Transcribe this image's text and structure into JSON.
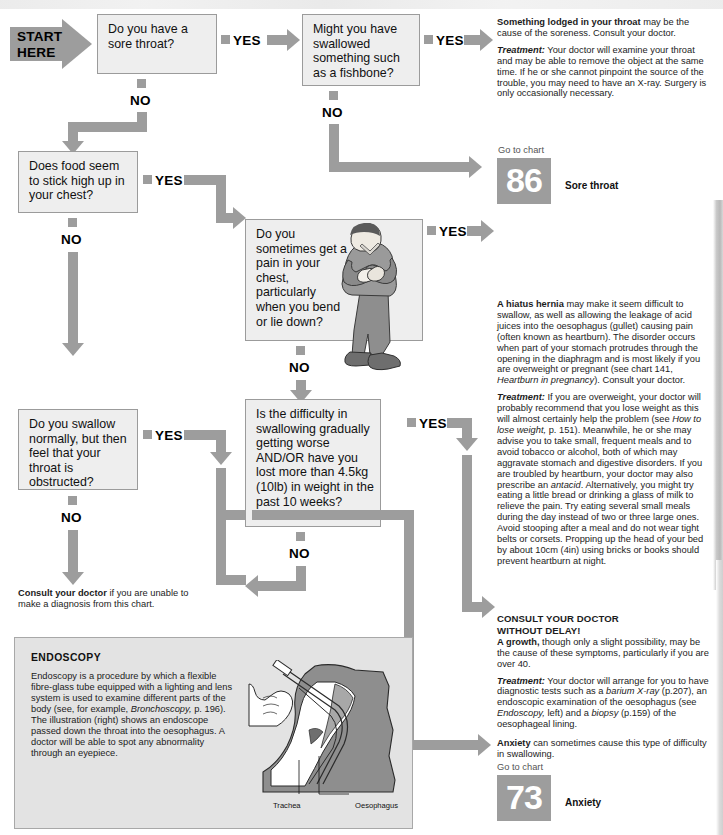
{
  "chart": {
    "start_line1": "START",
    "start_line2": "HERE"
  },
  "questions": [
    {
      "id": "q1",
      "text": "Do you have a sore throat?"
    },
    {
      "id": "q2",
      "text": "Might you have swallowed something such as a fishbone?"
    },
    {
      "id": "q3",
      "text": "Does food seem to stick high up in your chest?"
    },
    {
      "id": "q4",
      "text": "Do you sometimes get a pain in your chest, particularly when you bend or lie down?"
    },
    {
      "id": "q5",
      "text": "Do you swallow normally, but then feel that your throat is obstructed?"
    },
    {
      "id": "q6",
      "text": "Is the difficulty in swallowing gradually getting worse AND/OR have you lost more than 4.5kg (10lb) in weight in the past 10 weeks?"
    }
  ],
  "branch_labels": {
    "yes": "YES",
    "no": "NO"
  },
  "advice": {
    "lodged": {
      "lead": "Something lodged in your throat",
      "lead_rest": " may be the cause of the soreness. Consult your doctor.",
      "treatment_label": "Treatment:",
      "treatment_text": " Your doctor will examine your throat and may be able to remove the object at the same time. If he or she cannot pinpoint the source of the trouble, you may need to have an X-ray. Surgery is only occasionally necessary."
    },
    "sore_throat_goto": {
      "goto": "Go to chart",
      "number": "86",
      "name": "Sore throat"
    },
    "hernia": {
      "lead": "A hiatus hernia",
      "lead_rest": " may make it seem difficult to swallow, as well as allowing the leakage of acid juices into the oesophagus (gullet) causing pain (often known as heartburn). The disorder occurs when part of your stomach protrudes through the opening in the diaphragm and is most likely if you are overweight or pregnant (see chart 141, ",
      "lead_italic": "Heartburn in pregnancy",
      "lead_tail": "). Consult your doctor.",
      "treatment_label": "Treatment:",
      "treatment_t1": " If you are overweight, your doctor will probably recommend that you lose weight as this will almost certainly help the problem (see ",
      "treatment_i1": "How to lose weight,",
      "treatment_t2": " p. 151). Meanwhile, he or she may advise you to take small, frequent meals and to avoid tobacco or alcohol, both of which may aggravate stomach and digestive disorders. If you are troubled by heartburn, your doctor may also prescribe an ",
      "treatment_i2": "antacid",
      "treatment_t3": ". Alternatively, you might try eating a little bread or drinking a glass of milk to relieve the pain. Try eating several small meals during the day instead of two or three large ones. Avoid stooping after a meal and do not wear tight belts or corsets. Propping up the head of your bed by about 10cm (4in) using bricks or books should prevent heartburn at night."
    },
    "growth": {
      "headline_l1": "CONSULT YOUR DOCTOR",
      "headline_l2": "WITHOUT DELAY!",
      "lead": "A growth,",
      "lead_rest": " though only a slight possibility, may be the cause of these symptoms, particularly if you are over 40.",
      "treatment_label": "Treatment:",
      "treatment_t1": " Your doctor will arrange for you to have diagnostic tests such as a ",
      "treatment_i1": "barium X-ray",
      "treatment_t2": " (p.207), an endoscopic examination of the oesophagus (see ",
      "treatment_i2": "Endoscopy,",
      "treatment_t3": " left) and a ",
      "treatment_i3": "biopsy",
      "treatment_t4": " (p.159) of the oesophageal lining."
    },
    "anxiety": {
      "lead": "Anxiety",
      "lead_rest": " can sometimes cause this type of difficulty in swallowing.",
      "goto": "Go to chart",
      "number": "73",
      "name": "Anxiety"
    },
    "consult": {
      "lead": "Consult your doctor",
      "lead_rest": " if you are unable to make a diagnosis from this chart."
    }
  },
  "endoscopy": {
    "title": "ENDOSCOPY",
    "body_t1": "Endoscopy is a procedure by which a flexible fibre-glass tube equipped with a lighting and lens system is used to examine different parts of the body (see, for example, ",
    "body_i1": "Bronchoscopy,",
    "body_t2": " p. 196). The illustration (right) shows an endoscope passed down the throat into the oesophagus. A doctor will be able to spot any abnormality through an eyepiece.",
    "figure_labels": {
      "trachea": "Trachea",
      "oesophagus": "Oesophagus"
    }
  },
  "colors": {
    "arrow_grey": "#9d9d9d",
    "box_fill": "#eeeeee",
    "box_border": "#9b9b9b",
    "panel_fill": "#e3e3e3",
    "text": "#1a1a1a"
  }
}
